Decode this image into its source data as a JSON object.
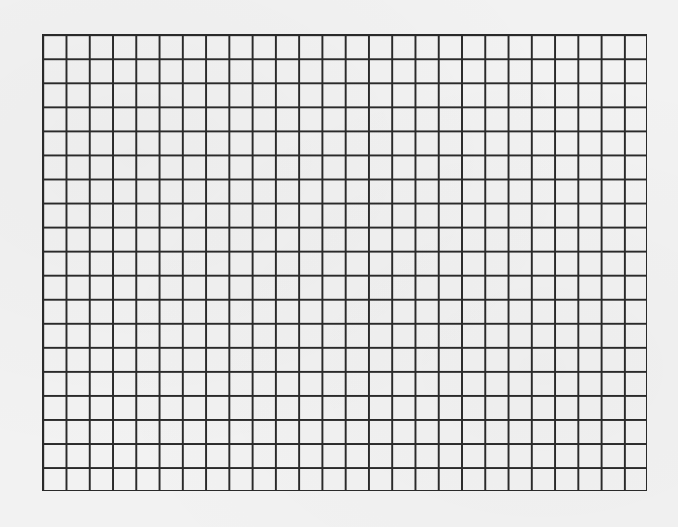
{
  "grid": {
    "columns": 26,
    "rows": 19,
    "line_color": "#2a2a2a",
    "background_color": "#f2f2f2"
  }
}
